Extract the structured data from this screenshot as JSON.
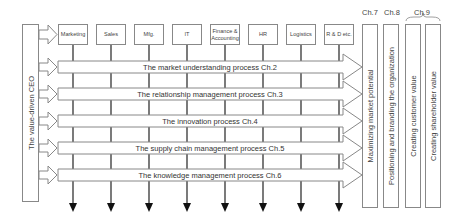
{
  "diagram": {
    "left_box": {
      "label": "The value-driven CEO"
    },
    "functions": [
      {
        "label": "Marketing"
      },
      {
        "label": "Sales"
      },
      {
        "label": "Mfg."
      },
      {
        "label": "IT"
      },
      {
        "label": "Finance & Accounting"
      },
      {
        "label": "HR"
      },
      {
        "label": "Logistics"
      },
      {
        "label": "R & D etc."
      }
    ],
    "processes": [
      {
        "label": "The market understanding process Ch.2"
      },
      {
        "label": "The relationship management process Ch.3"
      },
      {
        "label": "The innovation process Ch.4"
      },
      {
        "label": "The supply chain management process Ch.5"
      },
      {
        "label": "The knowledge management process Ch.6"
      }
    ],
    "outcomes": [
      {
        "chapter": "Ch.7",
        "label": "Maximizing market potential"
      },
      {
        "chapter": "Ch.8",
        "label": "Positioning and branding the organization"
      },
      {
        "chapter": "",
        "label": "Creating customer value"
      },
      {
        "chapter": "",
        "label": "Creating shareholder value"
      }
    ],
    "group_label": "Ch.9",
    "colors": {
      "stroke": "#888888",
      "line": "#222222",
      "text": "#333333"
    }
  }
}
